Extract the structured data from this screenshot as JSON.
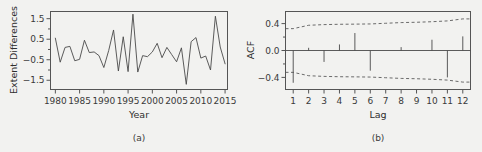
{
  "figure": {
    "background_color": "#f2f2f0",
    "line_color": "#4a4a4a",
    "axis_color": "#555555"
  },
  "panel_a": {
    "caption": "(a)",
    "ylabel": "Extent Differences",
    "xlabel": "Year"
  },
  "panel_b": {
    "caption": "(b)",
    "ylabel": "ACF",
    "xlabel": "Lag"
  },
  "chart_data": [
    {
      "type": "line",
      "panel": "(a)",
      "title": "",
      "xlabel": "Year",
      "ylabel": "Extent Differences",
      "xlim": [
        1979.0,
        2015.5
      ],
      "ylim": [
        -1.95,
        1.85
      ],
      "xticks": [
        1980,
        1985,
        1990,
        1995,
        2000,
        2005,
        2010,
        2015
      ],
      "xtick_labels": [
        "1980",
        "1985",
        "1990",
        "1995",
        "2000",
        "2005",
        "2010",
        "2015"
      ],
      "yticks": [
        -1.5,
        -0.5,
        0.5,
        1.5
      ],
      "ytick_labels": [
        "-1.5",
        "-0.5",
        "0.5",
        "1.5"
      ],
      "yminor_ticks": [
        -1.0,
        0.0,
        1.0
      ],
      "grid": false,
      "legend": "none",
      "x": [
        1980,
        1981,
        1982,
        1983,
        1984,
        1985,
        1986,
        1987,
        1988,
        1989,
        1990,
        1991,
        1992,
        1993,
        1994,
        1995,
        1996,
        1997,
        1998,
        1999,
        2000,
        2001,
        2002,
        2003,
        2004,
        2005,
        2006,
        2007,
        2008,
        2009,
        2010,
        2011,
        2012,
        2013,
        2014,
        2015
      ],
      "y": [
        0.55,
        -0.62,
        0.1,
        0.15,
        -0.55,
        -0.48,
        0.45,
        -0.15,
        -0.12,
        -0.3,
        -0.88,
        -0.05,
        0.95,
        -1.05,
        0.62,
        -1.08,
        1.72,
        -1.1,
        -0.3,
        -0.35,
        -0.12,
        0.3,
        -0.4,
        0.1,
        -0.25,
        -0.6,
        0.08,
        -1.7,
        0.38,
        0.58,
        -0.42,
        -0.32,
        -1.0,
        1.62,
        0.12,
        -0.7
      ],
      "series": [
        {
          "name": "Extent Differences",
          "values": [
            0.55,
            -0.62,
            0.1,
            0.15,
            -0.55,
            -0.48,
            0.45,
            -0.15,
            -0.12,
            -0.3,
            -0.88,
            -0.05,
            0.95,
            -1.05,
            0.62,
            -1.08,
            1.72,
            -1.1,
            -0.3,
            -0.35,
            -0.12,
            0.3,
            -0.4,
            0.1,
            -0.25,
            -0.6,
            0.08,
            -1.7,
            0.38,
            0.58,
            -0.42,
            -0.32,
            -1.0,
            1.62,
            0.12,
            -0.7
          ]
        }
      ]
    },
    {
      "type": "bar",
      "panel": "(b)",
      "title": "",
      "xlabel": "Lag",
      "ylabel": "ACF",
      "xlim": [
        0.5,
        12.5
      ],
      "ylim": [
        -0.58,
        0.58
      ],
      "xticks": [
        1,
        2,
        3,
        4,
        5,
        6,
        7,
        8,
        9,
        10,
        11,
        12
      ],
      "xtick_labels": [
        "1",
        "2",
        "3",
        "4",
        "5",
        "6",
        "7",
        "8",
        "9",
        "10",
        "11",
        "12"
      ],
      "yticks": [
        -0.4,
        0.0,
        0.4
      ],
      "ytick_labels": [
        "-0.4",
        "0.0",
        "0.4"
      ],
      "yminor_ticks": [
        -0.2,
        0.2
      ],
      "grid": false,
      "legend": "none",
      "categories": [
        "1",
        "2",
        "3",
        "4",
        "5",
        "6",
        "7",
        "8",
        "9",
        "10",
        "11",
        "12"
      ],
      "values": [
        -0.48,
        0.04,
        -0.17,
        0.09,
        0.26,
        -0.3,
        0.0,
        0.05,
        0.0,
        0.16,
        -0.4,
        0.21
      ],
      "confidence_upper": [
        0.325,
        0.375,
        0.385,
        0.39,
        0.392,
        0.395,
        0.405,
        0.415,
        0.42,
        0.428,
        0.44,
        0.47
      ],
      "confidence_lower": [
        -0.325,
        -0.375,
        -0.385,
        -0.39,
        -0.392,
        -0.395,
        -0.405,
        -0.415,
        -0.42,
        -0.428,
        -0.44,
        -0.47
      ]
    }
  ]
}
